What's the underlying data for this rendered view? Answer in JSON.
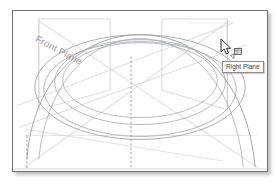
{
  "app": {
    "title": "CAD 3D Viewport",
    "background_color": "#ffffff",
    "border_color": "#6e6e6e"
  },
  "viewport": {
    "name": "graphics-area",
    "width": 256,
    "height": 162,
    "geometry_color": "#8f9196",
    "plane_color": "#c9cbd0",
    "construction_color": "#b9bcc2",
    "centerline_color": "#9fa2a8"
  },
  "annotations": {
    "front_plane_label": "Front Plane",
    "right_plane_label": "Right Plane"
  },
  "cursor": {
    "icon": "arrow-cursor",
    "badge_icon": "plane-select-glyph",
    "x": 207,
    "y": 27
  },
  "tooltip": {
    "text": "Right Plane",
    "x": 209,
    "y": 50
  },
  "model": {
    "type": "revolved-surface",
    "description": "Sphere/torus revolved profile with reference planes",
    "silhouette_ellipses": 4,
    "reference_planes": [
      "Front Plane",
      "Right Plane"
    ],
    "centerlines": 2
  }
}
